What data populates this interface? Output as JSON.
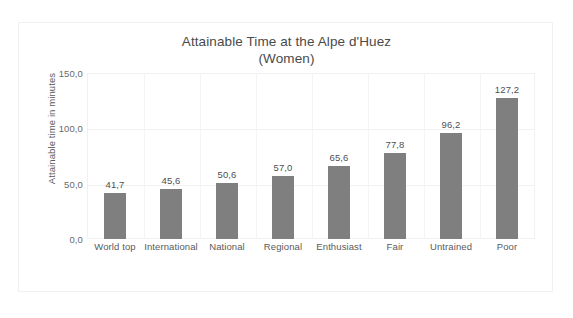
{
  "top_clipped_text": "",
  "chart_data": {
    "type": "bar",
    "title": "Attainable Time at the Alpe d'Huez",
    "title_line2": "(Women)",
    "xlabel": "",
    "ylabel": "Attainable  time in minutes",
    "categories": [
      "World top",
      "International",
      "National",
      "Regional",
      "Enthusiast",
      "Fair",
      "Untrained",
      "Poor"
    ],
    "values": [
      41.7,
      45.6,
      50.6,
      57.0,
      65.6,
      77.8,
      96.2,
      127.2
    ],
    "value_labels": [
      "41,7",
      "45,6",
      "50,6",
      "57,0",
      "65,6",
      "77,8",
      "96,2",
      "127,2"
    ],
    "ylim": [
      0,
      150
    ],
    "yticks": [
      0,
      50,
      100,
      150
    ],
    "ytick_labels": [
      "0,0",
      "50,0",
      "100,0",
      "150,0"
    ],
    "grid": true,
    "legend": false,
    "bar_color": "#7f7f7f",
    "gridline_color": "#f1f1f3",
    "text_color": "#595959",
    "background": "#ffffff"
  }
}
